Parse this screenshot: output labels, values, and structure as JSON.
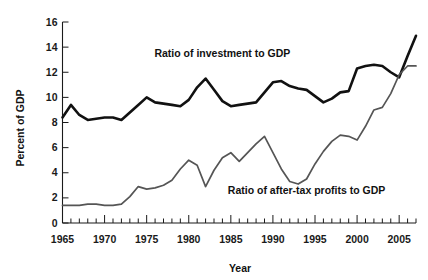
{
  "chart_data": {
    "type": "line",
    "title": "",
    "xlabel": "Year",
    "ylabel": "Percent of GDP",
    "xlim": [
      1965,
      2007
    ],
    "ylim": [
      0,
      16
    ],
    "yticks": [
      0,
      2,
      4,
      6,
      8,
      10,
      12,
      14,
      16
    ],
    "ytick_labels": [
      "0",
      "2",
      "4",
      "6",
      "8",
      "10",
      "12",
      "14",
      "16"
    ],
    "xticks": [
      1965,
      1970,
      1975,
      1980,
      1985,
      1990,
      1995,
      2000,
      2005
    ],
    "xtick_labels": [
      "1965",
      "1970",
      "1975",
      "1980",
      "1985",
      "1990",
      "1995",
      "2000",
      "2005"
    ],
    "x_minor_tick_step": 1,
    "grid": false,
    "legend_position": "inline-annotation",
    "x": [
      1965,
      1966,
      1967,
      1968,
      1969,
      1970,
      1971,
      1972,
      1973,
      1974,
      1975,
      1976,
      1977,
      1978,
      1979,
      1980,
      1981,
      1982,
      1983,
      1984,
      1985,
      1986,
      1987,
      1988,
      1989,
      1990,
      1991,
      1992,
      1993,
      1994,
      1995,
      1996,
      1997,
      1998,
      1999,
      2000,
      2001,
      2002,
      2003,
      2004,
      2005,
      2006,
      2007
    ],
    "series": [
      {
        "name": "Ratio of investment to GDP",
        "color": "#111111",
        "stroke_width": 2.6,
        "label_x": 1984,
        "label_y": 13.2,
        "values": [
          8.4,
          9.4,
          8.6,
          8.2,
          8.3,
          8.4,
          8.4,
          8.2,
          8.8,
          9.4,
          10.0,
          9.6,
          9.5,
          9.4,
          9.3,
          9.8,
          10.8,
          11.5,
          10.6,
          9.7,
          9.3,
          9.4,
          9.5,
          9.6,
          10.4,
          11.2,
          11.3,
          10.9,
          10.7,
          10.6,
          10.1,
          9.6,
          9.9,
          10.4,
          10.5,
          12.3,
          12.5,
          12.6,
          12.5,
          12.0,
          11.6,
          13.3,
          14.9
        ]
      },
      {
        "name": "Ratio of after-tax profits to GDP",
        "color": "#555555",
        "stroke_width": 1.7,
        "label_x": 1994,
        "label_y": 2.3,
        "values": [
          1.4,
          1.4,
          1.4,
          1.5,
          1.5,
          1.4,
          1.4,
          1.5,
          2.1,
          2.9,
          2.7,
          2.8,
          3.0,
          3.4,
          4.3,
          5.0,
          4.6,
          2.9,
          4.2,
          5.2,
          5.6,
          4.9,
          5.6,
          6.3,
          6.9,
          5.6,
          4.3,
          3.3,
          3.1,
          3.5,
          4.7,
          5.7,
          6.5,
          7.0,
          6.9,
          6.6,
          7.7,
          9.0,
          9.2,
          10.3,
          11.8,
          12.5,
          12.5
        ]
      }
    ]
  }
}
